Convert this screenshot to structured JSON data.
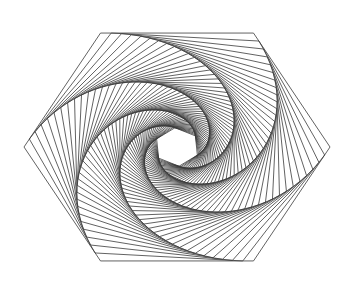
{
  "figure": {
    "shape": "hexagon",
    "sides": 6,
    "center": [
      177,
      147
    ],
    "outer_radius": 153,
    "outer_vertex_angle_deg": 0,
    "step_fraction": 0.07,
    "iterations": 57,
    "stroke_color": "#3a3a3a",
    "stroke_width": 0.8,
    "background": "#ffffff"
  }
}
